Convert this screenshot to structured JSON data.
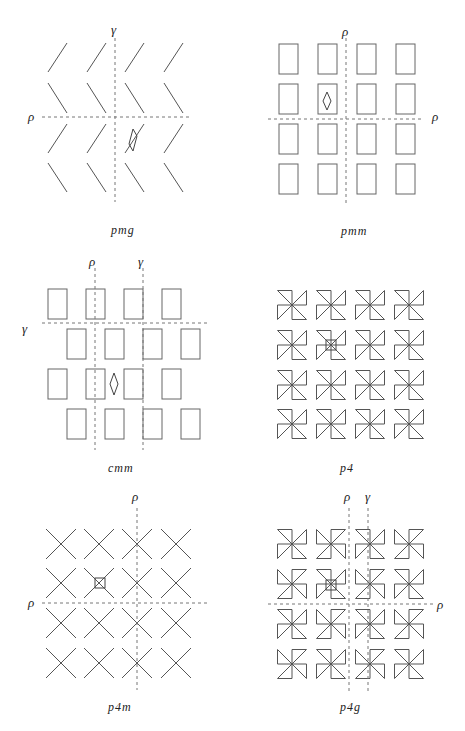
{
  "figure": {
    "panels": [
      {
        "id": "pmg",
        "caption": "pmg",
        "motif": "chevron",
        "grid": {
          "cols": 4,
          "rows": 4
        },
        "axes": [
          {
            "orientation": "vertical",
            "label": "γ",
            "kind": "glide"
          },
          {
            "orientation": "horizontal",
            "label": "ρ",
            "kind": "mirror"
          }
        ],
        "marker": "rhombus"
      },
      {
        "id": "pmm",
        "caption": "pmm",
        "motif": "rectangle",
        "grid": {
          "cols": 4,
          "rows": 4
        },
        "axes": [
          {
            "orientation": "vertical",
            "label": "ρ",
            "kind": "mirror"
          },
          {
            "orientation": "horizontal",
            "label": "ρ",
            "kind": "mirror"
          }
        ],
        "marker": "rhombus"
      },
      {
        "id": "cmm",
        "caption": "cmm",
        "motif": "rectangle-staggered",
        "grid": {
          "cols": 4,
          "rows": 4
        },
        "axes": [
          {
            "orientation": "vertical",
            "label": "ρ",
            "kind": "mirror"
          },
          {
            "orientation": "vertical",
            "label": "γ",
            "kind": "glide"
          },
          {
            "orientation": "horizontal",
            "label": "γ",
            "kind": "glide"
          }
        ],
        "marker": "rhombus"
      },
      {
        "id": "p4",
        "caption": "p4",
        "motif": "pinwheel",
        "grid": {
          "cols": 4,
          "rows": 4
        },
        "axes": [],
        "marker": "square"
      },
      {
        "id": "p4m",
        "caption": "p4m",
        "motif": "cross",
        "grid": {
          "cols": 4,
          "rows": 4
        },
        "axes": [
          {
            "orientation": "vertical",
            "label": "ρ",
            "kind": "mirror"
          },
          {
            "orientation": "horizontal",
            "label": "ρ",
            "kind": "mirror"
          }
        ],
        "marker": "square"
      },
      {
        "id": "p4g",
        "caption": "p4g",
        "motif": "pinwheel-alternating",
        "grid": {
          "cols": 4,
          "rows": 4
        },
        "axes": [
          {
            "orientation": "vertical",
            "label": "ρ",
            "kind": "mirror"
          },
          {
            "orientation": "vertical",
            "label": "γ",
            "kind": "glide"
          },
          {
            "orientation": "horizontal",
            "label": "ρ",
            "kind": "mirror"
          }
        ],
        "marker": "square"
      }
    ],
    "colors": {
      "stroke": "#555555",
      "axis": "#777777",
      "text": "#222222",
      "background": "#ffffff"
    }
  }
}
